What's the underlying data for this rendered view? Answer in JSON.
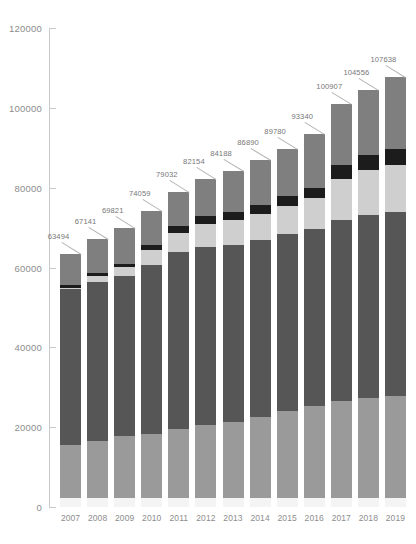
{
  "chart_data": {
    "type": "bar",
    "stacked": true,
    "title": "",
    "subtitle": "",
    "xlabel": "",
    "ylabel": "",
    "ylim": [
      0,
      120000
    ],
    "ytick_labels": [
      "120000",
      "100000",
      "80000",
      "60000",
      "40000",
      "20000",
      "0"
    ],
    "ytick_values": [
      120000,
      100000,
      80000,
      60000,
      40000,
      20000,
      0
    ],
    "grid": false,
    "legend": "none",
    "categories": [
      "2007",
      "2008",
      "2009",
      "2010",
      "2011",
      "2012",
      "2013",
      "2014",
      "2015",
      "2016",
      "2017",
      "2018",
      "2019"
    ],
    "totals": [
      63494,
      67141,
      69821,
      74059,
      79032,
      82154,
      84188,
      86890,
      89780,
      93340,
      100907,
      104556,
      107638
    ],
    "total_labels": [
      "63494",
      "67141",
      "69821",
      "74059",
      "79032",
      "82154",
      "84188",
      "86890",
      "89780",
      "93340",
      "100907",
      "104556",
      "107638"
    ],
    "series": [
      {
        "name": "series-1",
        "color": "#f4f4f4",
        "values": [
          2300,
          2300,
          2300,
          2300,
          2300,
          2300,
          2300,
          2300,
          2300,
          2300,
          2300,
          2300,
          2300
        ]
      },
      {
        "name": "series-2",
        "color": "#9a9a9a",
        "values": [
          13200,
          14200,
          15400,
          16000,
          17200,
          18300,
          19100,
          20200,
          21800,
          23000,
          24200,
          25000,
          25500
        ]
      },
      {
        "name": "series-3",
        "color": "#565656",
        "values": [
          39000,
          39900,
          40200,
          42400,
          44300,
          44600,
          44300,
          44300,
          44200,
          44400,
          45500,
          45900,
          46000
        ]
      },
      {
        "name": "series-4",
        "color": "#cfcfcf",
        "values": [
          300,
          1400,
          2200,
          3600,
          4800,
          5800,
          6200,
          6700,
          7100,
          7600,
          10300,
          11300,
          12000
        ]
      },
      {
        "name": "series-5",
        "color": "#1c1c1c",
        "values": [
          700,
          800,
          900,
          1300,
          1700,
          1900,
          2000,
          2200,
          2400,
          2600,
          3400,
          3600,
          3800
        ]
      },
      {
        "name": "series-6",
        "color": "#7f7f7f",
        "values": [
          7994,
          8541,
          8821,
          8459,
          8732,
          9254,
          10288,
          11190,
          11980,
          13440,
          15207,
          16456,
          18038
        ]
      }
    ]
  }
}
